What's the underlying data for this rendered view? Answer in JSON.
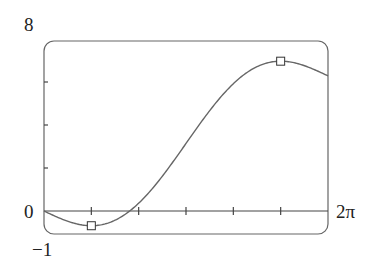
{
  "chart_data": {
    "type": "line",
    "title": "",
    "xlabel": "",
    "ylabel": "",
    "function_shape": "y = x - 2 sin(x)",
    "xlim": [
      0,
      6.2832
    ],
    "ylim": [
      -1,
      8
    ],
    "x_tick_labels": [
      "0",
      "2π"
    ],
    "y_tick_labels": [
      "8",
      "0",
      "−1"
    ],
    "x_ticks": [
      1.0472,
      2.0944,
      3.1416,
      4.1888,
      5.236
    ],
    "y_ticks": [
      2,
      4,
      6
    ],
    "grid": false,
    "legend": null,
    "series": [
      {
        "name": "curve",
        "x": [
          0,
          0.5236,
          1.0472,
          1.5708,
          2.0944,
          2.618,
          3.1416,
          3.6652,
          4.1888,
          4.7124,
          5.236,
          5.7596,
          6.2832
        ],
        "y": [
          0,
          -0.476,
          -0.685,
          -0.429,
          0.362,
          1.618,
          3.142,
          4.665,
          5.921,
          6.712,
          6.968,
          6.76,
          6.283
        ]
      }
    ],
    "markers": [
      {
        "label": "local-min",
        "x": 1.0472,
        "y": -0.685
      },
      {
        "label": "local-max",
        "x": 5.236,
        "y": 6.968
      }
    ]
  },
  "labels": {
    "y_max": "8",
    "origin": "0",
    "y_min": "−1",
    "x_max": "2π"
  }
}
